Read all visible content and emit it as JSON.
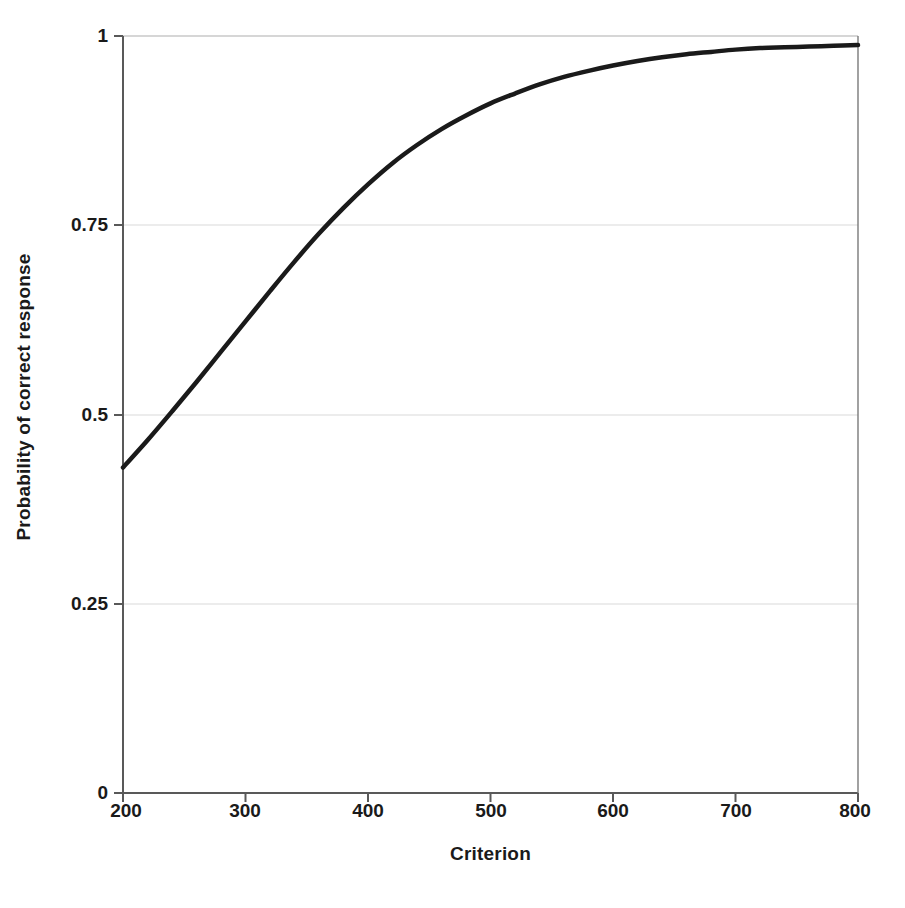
{
  "chart_data": {
    "type": "line",
    "title": "",
    "xlabel": "Criterion",
    "ylabel": "Probability of correct response",
    "xlim": [
      200,
      800
    ],
    "ylim": [
      0,
      1
    ],
    "xticks": [
      200,
      300,
      400,
      500,
      600,
      700,
      800
    ],
    "xtick_labels": [
      "200",
      "300",
      "400",
      "500",
      "600",
      "700",
      "800"
    ],
    "yticks": [
      0,
      0.25,
      0.5,
      0.75,
      1
    ],
    "ytick_labels": [
      "0",
      "0.25",
      "0.5",
      "0.75",
      "1"
    ],
    "grid": "horizontal",
    "grid_color": "#d9d9d9",
    "axis_color": "#595959",
    "legend": "none",
    "series": [
      {
        "name": "Probability of correct response",
        "color": "#1a1a1a",
        "line_width": 4.5,
        "x": [
          200,
          220,
          240,
          260,
          280,
          300,
          320,
          340,
          360,
          380,
          400,
          420,
          440,
          460,
          480,
          500,
          520,
          540,
          560,
          580,
          600,
          620,
          640,
          660,
          680,
          700,
          720,
          740,
          760,
          780,
          800
        ],
        "y": [
          0.43,
          0.466,
          0.504,
          0.543,
          0.583,
          0.623,
          0.663,
          0.702,
          0.739,
          0.773,
          0.804,
          0.832,
          0.856,
          0.877,
          0.895,
          0.911,
          0.924,
          0.936,
          0.946,
          0.954,
          0.961,
          0.967,
          0.972,
          0.976,
          0.979,
          0.982,
          0.984,
          0.985,
          0.986,
          0.987,
          0.988
        ]
      }
    ],
    "annotations": []
  }
}
